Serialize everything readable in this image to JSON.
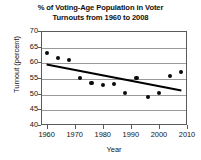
{
  "chart_data": {
    "type": "scatter",
    "title": "% of Voting-Age Population in Voter Turnouts from 1960 to 2008",
    "title_line1": "% of Voting-Age Population in Voter",
    "title_line2": "Turnouts from 1960 to 2008",
    "xlabel": "Year",
    "ylabel": "Turnout (percent)",
    "xlim": [
      1958,
      2010
    ],
    "ylim": [
      40,
      70
    ],
    "xticks": [
      1960,
      1970,
      1980,
      1990,
      2000,
      2010
    ],
    "yticks": [
      40,
      45,
      50,
      55,
      60,
      65,
      70
    ],
    "grid": true,
    "legend": "none",
    "marker_color": "#0a0a0a",
    "trendline_color": "#000000",
    "x": [
      1960,
      1964,
      1968,
      1972,
      1976,
      1980,
      1984,
      1988,
      1992,
      1996,
      2000,
      2004,
      2008
    ],
    "y": [
      63.0,
      61.5,
      60.7,
      55.0,
      53.5,
      52.8,
      53.2,
      50.2,
      55.0,
      49.0,
      50.1,
      55.6,
      57.0
    ],
    "series": [
      {
        "name": "Voter turnout",
        "type": "scatter",
        "values": [
          63.0,
          61.5,
          60.7,
          55.0,
          53.5,
          52.8,
          53.2,
          50.2,
          55.0,
          49.0,
          50.1,
          55.6,
          57.0
        ]
      },
      {
        "name": "Trend line",
        "type": "line",
        "endpoints": [
          {
            "x": 1960,
            "y": 59.3
          },
          {
            "x": 2008,
            "y": 51.0
          }
        ]
      }
    ]
  }
}
